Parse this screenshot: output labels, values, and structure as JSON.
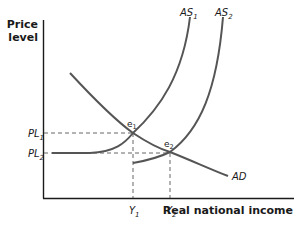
{
  "diagram": {
    "type": "aggregate-supply-demand",
    "y_axis_label_line1": "Price",
    "y_axis_label_line2": "level",
    "x_axis_label": "Real national income",
    "curves": {
      "as1": {
        "label": "AS",
        "sub": "1"
      },
      "as2": {
        "label": "AS",
        "sub": "2"
      },
      "ad": {
        "label": "AD"
      }
    },
    "equilibria": {
      "e1": {
        "label": "e",
        "sub": "1"
      },
      "e2": {
        "label": "e",
        "sub": "2"
      }
    },
    "price_levels": {
      "pl1": {
        "label": "PL",
        "sub": "1"
      },
      "pl2": {
        "label": "PL",
        "sub": "2"
      }
    },
    "incomes": {
      "y1": {
        "label": "Y",
        "sub": "1"
      },
      "y2": {
        "label": "Y",
        "sub": "2"
      }
    },
    "colors": {
      "axis": "#1a1a1a",
      "curve": "#555555",
      "dash": "#555555",
      "text": "#1a1a1a"
    }
  }
}
